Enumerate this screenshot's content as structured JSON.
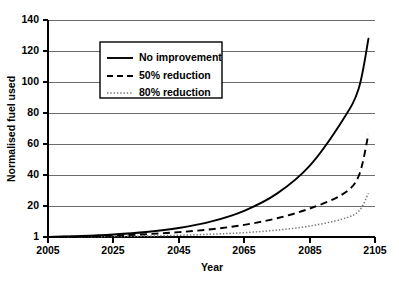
{
  "chart_data": {
    "type": "line",
    "title": "",
    "xlabel": "Year",
    "ylabel": "Normalised fuel used",
    "xlim": [
      2005,
      2105
    ],
    "ylim": [
      1,
      140
    ],
    "grid": "horizontal",
    "legend_position": "upper-left-center",
    "xticks": [
      "2005",
      "2025",
      "2045",
      "2065",
      "2085",
      "2105"
    ],
    "yticks": [
      "1",
      "20",
      "40",
      "60",
      "80",
      "100",
      "120",
      "140"
    ],
    "x": [
      2005,
      2015,
      2025,
      2035,
      2045,
      2055,
      2065,
      2075,
      2085,
      2095,
      2100,
      2103
    ],
    "series": [
      {
        "name": "No improvement",
        "style": "solid",
        "color": "#000000",
        "values": [
          1,
          1.6,
          2.6,
          4.2,
          6.8,
          11.0,
          17.8,
          28.8,
          46.6,
          75.5,
          96.0,
          128.0
        ]
      },
      {
        "name": "50% reduction",
        "style": "dashed",
        "color": "#000000",
        "values": [
          1,
          1.3,
          1.9,
          2.8,
          4.1,
          6.0,
          8.8,
          13.0,
          19.2,
          28.3,
          40.0,
          67.0
        ]
      },
      {
        "name": "80% reduction",
        "style": "dotted",
        "color": "#777777",
        "values": [
          1,
          1.1,
          1.3,
          1.6,
          2.1,
          2.8,
          3.8,
          5.4,
          8.0,
          12.5,
          17.5,
          29.0
        ]
      }
    ]
  },
  "legend": {
    "items": [
      {
        "label": "No improvement",
        "style": "solid"
      },
      {
        "label": "50% reduction",
        "style": "dashed"
      },
      {
        "label": "80% reduction",
        "style": "dotted"
      }
    ]
  },
  "axes": {
    "x_title": "Year",
    "y_title": "Normalised fuel used",
    "x_labels": [
      "2005",
      "2025",
      "2045",
      "2065",
      "2085",
      "2105"
    ],
    "y_labels": [
      "1",
      "20",
      "40",
      "60",
      "80",
      "100",
      "120",
      "140"
    ]
  },
  "caption": {
    "text": ""
  }
}
